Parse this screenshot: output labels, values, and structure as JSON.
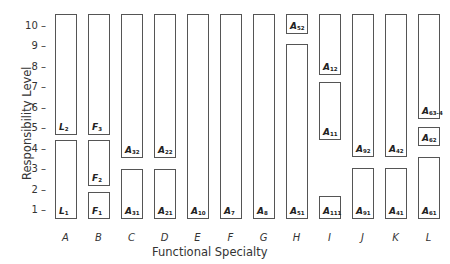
{
  "diagram": {
    "y_axis": {
      "label": "Responsibility Level",
      "ticks": [
        {
          "label": "10 –",
          "level": 10
        },
        {
          "label": "9 –",
          "level": 9
        },
        {
          "label": "8 –",
          "level": 8
        },
        {
          "label": "7 –",
          "level": 7
        },
        {
          "label": "6 –",
          "level": 6
        },
        {
          "label": "5 –",
          "level": 5
        },
        {
          "label": "4 –",
          "level": 4
        },
        {
          "label": "3 –",
          "level": 3
        },
        {
          "label": "2 –",
          "level": 2
        },
        {
          "label": "1 –",
          "level": 1
        }
      ]
    },
    "x_axis": {
      "label": "Functional Specialty",
      "columns": [
        "A",
        "B",
        "C",
        "D",
        "E",
        "F",
        "G",
        "H",
        "I",
        "J",
        "K",
        "L"
      ]
    },
    "boxes": [
      {
        "column": "A",
        "base": "L",
        "sub": "2",
        "top": 14,
        "bottom": 135
      },
      {
        "column": "A",
        "base": "L",
        "sub": "1",
        "top": 140,
        "bottom": 219
      },
      {
        "column": "B",
        "base": "F",
        "sub": "3",
        "top": 14,
        "bottom": 135
      },
      {
        "column": "B",
        "base": "F",
        "sub": "2",
        "top": 140,
        "bottom": 186
      },
      {
        "column": "B",
        "base": "F",
        "sub": "1",
        "top": 192,
        "bottom": 219
      },
      {
        "column": "C",
        "base": "A",
        "sub": "32",
        "top": 14,
        "bottom": 158
      },
      {
        "column": "C",
        "base": "A",
        "sub": "31",
        "top": 169,
        "bottom": 219
      },
      {
        "column": "D",
        "base": "A",
        "sub": "22",
        "top": 14,
        "bottom": 158
      },
      {
        "column": "D",
        "base": "A",
        "sub": "21",
        "top": 169,
        "bottom": 219
      },
      {
        "column": "E",
        "base": "A",
        "sub": "10",
        "top": 14,
        "bottom": 219
      },
      {
        "column": "F",
        "base": "A",
        "sub": "7",
        "top": 14,
        "bottom": 219
      },
      {
        "column": "G",
        "base": "A",
        "sub": "8",
        "top": 14,
        "bottom": 219
      },
      {
        "column": "H",
        "base": "A",
        "sub": "52",
        "top": 14,
        "bottom": 34
      },
      {
        "column": "H",
        "base": "A",
        "sub": "51",
        "top": 44,
        "bottom": 219
      },
      {
        "column": "I",
        "base": "A",
        "sub": "12",
        "top": 14,
        "bottom": 75
      },
      {
        "column": "I",
        "base": "A",
        "sub": "11",
        "top": 82,
        "bottom": 140
      },
      {
        "column": "I",
        "base": "A",
        "sub": "111",
        "top": 196,
        "bottom": 219
      },
      {
        "column": "J",
        "base": "A",
        "sub": "92",
        "top": 14,
        "bottom": 157
      },
      {
        "column": "J",
        "base": "A",
        "sub": "91",
        "top": 168,
        "bottom": 219
      },
      {
        "column": "K",
        "base": "A",
        "sub": "42",
        "top": 14,
        "bottom": 157
      },
      {
        "column": "K",
        "base": "A",
        "sub": "41",
        "top": 168,
        "bottom": 219
      },
      {
        "column": "L",
        "base": "A",
        "sub": "63-4",
        "top": 14,
        "bottom": 119
      },
      {
        "column": "L",
        "base": "A",
        "sub": "62",
        "top": 127,
        "bottom": 146
      },
      {
        "column": "L",
        "base": "A",
        "sub": "61",
        "top": 157,
        "bottom": 219
      }
    ]
  }
}
